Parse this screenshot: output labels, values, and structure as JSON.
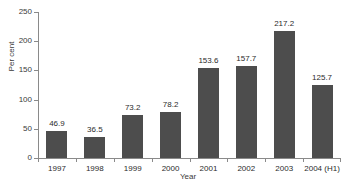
{
  "title_sliver": "",
  "chart_data": {
    "type": "bar",
    "title": "",
    "xlabel": "Year",
    "ylabel": "Per cent",
    "categories": [
      "1997",
      "1998",
      "1999",
      "2000",
      "2001",
      "2002",
      "2003",
      "2004 (H1)"
    ],
    "values": [
      46.9,
      36.5,
      73.2,
      78.2,
      153.6,
      157.7,
      217.2,
      125.7
    ],
    "value_labels": [
      "46.9",
      "36.5",
      "73.2",
      "78.2",
      "153.6",
      "157.7",
      "217.2",
      "125.7"
    ],
    "ylim": [
      0,
      250
    ],
    "yticks": [
      0,
      50,
      100,
      150,
      200,
      250
    ],
    "ytick_labels": [
      "0",
      "50",
      "100",
      "150",
      "200",
      "250"
    ],
    "grid": false,
    "legend": "none",
    "bar_color": "#4d4d4d",
    "axis_color": "#8a8a8a",
    "background": "#ffffff"
  }
}
